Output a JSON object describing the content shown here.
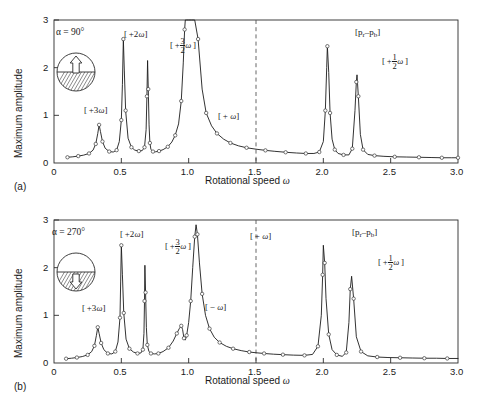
{
  "figure": {
    "panels": [
      {
        "id": "a",
        "caption": "(a)",
        "alpha_label": "α = 90°",
        "inset": {
          "name": "half-filled-circle-up-arrow",
          "arrow_direction": "up"
        },
        "axes": {
          "xlabel_text": "Rotational speed",
          "xlabel_symbol": "ω",
          "ylabel": "Maximum amplitude",
          "xticks": [
            "0",
            "0.5",
            "1.0",
            "1.5",
            "2.0",
            "2.5",
            "3.0"
          ],
          "xtick_values": [
            0,
            0.5,
            1.0,
            1.5,
            2.0,
            2.5,
            3.0
          ],
          "yticks": [
            "0",
            "1",
            "2",
            "3"
          ],
          "ytick_values": [
            0,
            1,
            2,
            3
          ],
          "xlim": [
            0,
            3
          ],
          "ylim": [
            0,
            3
          ]
        },
        "annotations": [
          {
            "name": "peak-label-3omega",
            "text": "[ +3ω]",
            "x": 0.335,
            "y": 1.02
          },
          {
            "name": "peak-label-2omega",
            "text": "[ +2ω]",
            "x": 0.52,
            "y": 2.82
          },
          {
            "name": "peak-label-3over2-omega",
            "text": "[ +3/2 ω ]",
            "x": 0.7,
            "y": 2.55
          },
          {
            "name": "peak-label-omega",
            "text": "[ + ω]",
            "x": 1.0,
            "y": 1.48
          },
          {
            "name": "peak-label-pr-pb",
            "text": "[pᵣ–pʙ]",
            "x": 2.05,
            "y": 2.85
          },
          {
            "name": "peak-label-half-omega",
            "text": "[ +1/2 ω ]",
            "x": 2.33,
            "y": 2.12
          }
        ],
        "dashed_line_x": 1.5
      },
      {
        "id": "b",
        "caption": "(b)",
        "alpha_label": "α = 270°",
        "inset": {
          "name": "half-filled-circle-down-arrow",
          "arrow_direction": "down"
        },
        "axes": {
          "xlabel_text": "Rotational speed",
          "xlabel_symbol": "ω",
          "ylabel": "Maximum amplitude",
          "xticks": [
            "0",
            "0.5",
            "1.0",
            "1.5",
            "2.0",
            "2.5",
            "3.0"
          ],
          "xtick_values": [
            0,
            0.5,
            1.0,
            1.5,
            2.0,
            2.5,
            3.0
          ],
          "yticks": [
            "0",
            "1",
            "2",
            "3"
          ],
          "ytick_values": [
            0,
            1,
            2,
            3
          ],
          "xlim": [
            0,
            3
          ],
          "ylim": [
            0,
            3
          ]
        },
        "annotations": [
          {
            "name": "peak-label-3omega",
            "text": "[ +3ω]",
            "x": 0.335,
            "y": 1.05
          },
          {
            "name": "peak-label-2omega",
            "text": "[ +2ω]",
            "x": 0.5,
            "y": 2.82
          },
          {
            "name": "peak-label-3over2-omega",
            "text": "[ +3/2 ω ]",
            "x": 0.69,
            "y": 2.48
          },
          {
            "name": "peak-label-minus-omega",
            "text": "[ − ω]",
            "x": 0.93,
            "y": 1.05
          },
          {
            "name": "peak-label-omega",
            "text": "[ + ω]",
            "x": 1.16,
            "y": 2.78
          },
          {
            "name": "peak-label-pr-pb",
            "text": "[pᵣ–pʙ]",
            "x": 2.03,
            "y": 2.85
          },
          {
            "name": "peak-label-half-omega",
            "text": "[ +1/2 ω ]",
            "x": 2.3,
            "y": 2.1
          }
        ],
        "dashed_line_x": 1.5
      }
    ]
  },
  "chart_data": [
    {
      "type": "line",
      "panel": "a",
      "title": "",
      "xlabel": "Rotational speed ω",
      "ylabel": "Maximum amplitude",
      "xlim": [
        0,
        3
      ],
      "ylim": [
        0,
        3
      ],
      "grid": false,
      "legend": null,
      "markers": "open-circle",
      "clipped_peak_note": "main [+ω] resonance at ω≈0.97 exceeds plot top (y=3) and is clipped",
      "peaks": [
        {
          "label": "[ +3ω]",
          "x": 0.335,
          "amplitude": 0.8
        },
        {
          "label": "[ +2ω]",
          "x": 0.515,
          "amplitude": 2.6
        },
        {
          "label": "[ +3/2 ω ]",
          "x": 0.695,
          "amplitude": 2.15
        },
        {
          "label": "[ + ω]",
          "x": 0.975,
          "amplitude": 3.0
        },
        {
          "label": "[pᵣ–pʙ]",
          "x": 2.03,
          "amplitude": 2.45
        },
        {
          "label": "[ +1/2 ω ]",
          "x": 2.25,
          "amplitude": 1.85
        }
      ],
      "x": [
        0.1,
        0.14,
        0.18,
        0.22,
        0.26,
        0.29,
        0.31,
        0.325,
        0.335,
        0.345,
        0.36,
        0.38,
        0.41,
        0.44,
        0.465,
        0.485,
        0.5,
        0.508,
        0.515,
        0.522,
        0.532,
        0.55,
        0.575,
        0.6,
        0.63,
        0.655,
        0.672,
        0.684,
        0.69,
        0.695,
        0.7,
        0.706,
        0.712,
        0.72,
        0.735,
        0.755,
        0.78,
        0.81,
        0.845,
        0.875,
        0.9,
        0.925,
        0.945,
        0.96,
        0.97,
        0.975,
        0.985,
        1.0,
        1.02,
        1.045,
        1.07,
        1.1,
        1.13,
        1.17,
        1.21,
        1.26,
        1.31,
        1.37,
        1.43,
        1.5,
        1.57,
        1.64,
        1.72,
        1.8,
        1.87,
        1.93,
        1.97,
        2.0,
        2.015,
        2.025,
        2.03,
        2.04,
        2.05,
        2.065,
        2.085,
        2.11,
        2.15,
        2.19,
        2.215,
        2.235,
        2.245,
        2.25,
        2.26,
        2.275,
        2.295,
        2.33,
        2.38,
        2.45,
        2.53,
        2.62,
        2.71,
        2.8,
        2.88,
        2.95,
        3.0
      ],
      "y": [
        0.12,
        0.13,
        0.145,
        0.165,
        0.2,
        0.27,
        0.4,
        0.62,
        0.8,
        0.66,
        0.45,
        0.31,
        0.24,
        0.23,
        0.27,
        0.45,
        0.9,
        1.65,
        2.6,
        1.95,
        1.1,
        0.52,
        0.33,
        0.27,
        0.25,
        0.26,
        0.33,
        0.7,
        1.4,
        2.15,
        1.55,
        0.8,
        0.42,
        0.28,
        0.24,
        0.235,
        0.25,
        0.28,
        0.34,
        0.44,
        0.58,
        0.82,
        1.3,
        2.1,
        2.8,
        3.0,
        3.0,
        3.0,
        3.0,
        3.0,
        2.6,
        1.55,
        1.05,
        0.78,
        0.62,
        0.5,
        0.42,
        0.36,
        0.32,
        0.29,
        0.265,
        0.245,
        0.225,
        0.21,
        0.2,
        0.2,
        0.23,
        0.45,
        1.1,
        2.0,
        2.45,
        1.9,
        1.05,
        0.5,
        0.28,
        0.2,
        0.17,
        0.17,
        0.3,
        1.1,
        1.7,
        1.85,
        1.4,
        0.6,
        0.28,
        0.18,
        0.155,
        0.14,
        0.13,
        0.125,
        0.12,
        0.115,
        0.11,
        0.11,
        0.11
      ]
    },
    {
      "type": "line",
      "panel": "b",
      "title": "",
      "xlabel": "Rotational speed ω",
      "ylabel": "Maximum amplitude",
      "xlim": [
        0,
        3
      ],
      "ylim": [
        0,
        3
      ],
      "grid": false,
      "legend": null,
      "markers": "open-circle",
      "peaks": [
        {
          "label": "[ +3ω]",
          "x": 0.325,
          "amplitude": 0.75
        },
        {
          "label": "[ +2ω]",
          "x": 0.5,
          "amplitude": 2.47
        },
        {
          "label": "[ +3/2 ω ]",
          "x": 0.675,
          "amplitude": 2.05
        },
        {
          "label": "[ − ω]",
          "x": 0.945,
          "amplitude": 0.78
        },
        {
          "label": "[ + ω]",
          "x": 1.055,
          "amplitude": 2.9
        },
        {
          "label": "[pᵣ–pʙ]",
          "x": 2.0,
          "amplitude": 2.47
        },
        {
          "label": "[ +1/2 ω ]",
          "x": 2.2,
          "amplitude": 1.82
        }
      ],
      "x": [
        0.09,
        0.13,
        0.17,
        0.21,
        0.25,
        0.28,
        0.3,
        0.315,
        0.325,
        0.335,
        0.35,
        0.37,
        0.4,
        0.43,
        0.455,
        0.475,
        0.49,
        0.495,
        0.5,
        0.508,
        0.518,
        0.535,
        0.56,
        0.59,
        0.62,
        0.645,
        0.66,
        0.668,
        0.672,
        0.675,
        0.68,
        0.686,
        0.693,
        0.705,
        0.72,
        0.745,
        0.775,
        0.81,
        0.85,
        0.885,
        0.912,
        0.93,
        0.945,
        0.955,
        0.965,
        0.975,
        0.985,
        1.0,
        1.015,
        1.03,
        1.045,
        1.055,
        1.065,
        1.08,
        1.1,
        1.125,
        1.155,
        1.19,
        1.23,
        1.28,
        1.33,
        1.39,
        1.45,
        1.5,
        1.56,
        1.63,
        1.7,
        1.78,
        1.86,
        1.92,
        1.96,
        1.985,
        1.995,
        2.0,
        2.01,
        2.02,
        2.04,
        2.065,
        2.1,
        2.14,
        2.17,
        2.19,
        2.2,
        2.21,
        2.225,
        2.245,
        2.28,
        2.33,
        2.4,
        2.48,
        2.57,
        2.66,
        2.75,
        2.84,
        2.92,
        3.0
      ],
      "y": [
        0.09,
        0.1,
        0.115,
        0.135,
        0.17,
        0.24,
        0.36,
        0.58,
        0.75,
        0.62,
        0.42,
        0.28,
        0.2,
        0.19,
        0.24,
        0.44,
        0.95,
        1.7,
        2.47,
        1.85,
        1.05,
        0.5,
        0.3,
        0.23,
        0.2,
        0.21,
        0.28,
        0.62,
        1.3,
        2.05,
        1.48,
        0.74,
        0.38,
        0.24,
        0.2,
        0.19,
        0.2,
        0.24,
        0.32,
        0.46,
        0.62,
        0.72,
        0.78,
        0.7,
        0.52,
        0.48,
        0.58,
        0.85,
        1.3,
        2.0,
        2.65,
        2.9,
        2.7,
        2.1,
        1.45,
        1.0,
        0.72,
        0.54,
        0.43,
        0.35,
        0.3,
        0.26,
        0.23,
        0.215,
        0.2,
        0.185,
        0.175,
        0.165,
        0.16,
        0.18,
        0.35,
        1.0,
        1.85,
        2.47,
        2.1,
        1.35,
        0.6,
        0.28,
        0.17,
        0.14,
        0.22,
        0.85,
        1.55,
        1.82,
        1.35,
        0.55,
        0.24,
        0.15,
        0.125,
        0.115,
        0.11,
        0.105,
        0.1,
        0.1,
        0.095,
        0.095
      ]
    }
  ]
}
